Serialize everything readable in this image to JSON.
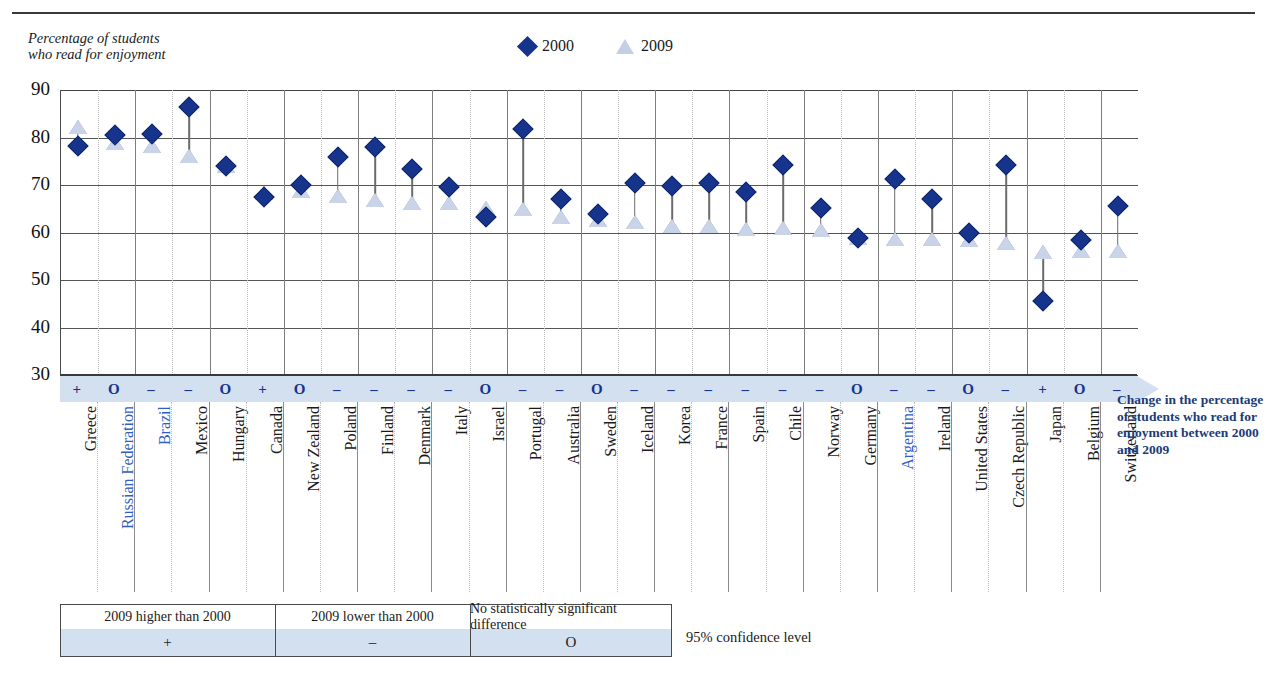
{
  "figure": {
    "y_caption_line1": "Percentage of students",
    "y_caption_line2": "who read for enjoyment",
    "annotation": "Change in the percentage of students who read for enjoyment between 2000 and 2009",
    "confidence_note": "95% confidence level"
  },
  "legend": [
    {
      "label": "2000",
      "marker": "diamond-icon",
      "color": "#16348c"
    },
    {
      "label": "2009",
      "marker": "triangle-icon",
      "color": "#c9d4e8"
    }
  ],
  "key_table": {
    "headers": [
      "2009 higher than 2000",
      "2009 lower than 2000",
      "No statistically significant difference"
    ],
    "symbols": [
      "+",
      "–",
      "O"
    ]
  },
  "chart_data": {
    "type": "scatter",
    "title": "",
    "xlabel": "",
    "ylabel": "Percentage of students who read for enjoyment",
    "ylim": [
      30,
      90
    ],
    "yticks": [
      90,
      80,
      70,
      60,
      50,
      40,
      30
    ],
    "grid": true,
    "legend_position": "top-center",
    "categories": [
      "Greece",
      "Russian Federation",
      "Brazil",
      "Mexico",
      "Hungary",
      "Canada",
      "New Zealand",
      "Poland",
      "Finland",
      "Denmark",
      "Italy",
      "Israel",
      "Portugal",
      "Australia",
      "Sweden",
      "Iceland",
      "Korea",
      "France",
      "Spain",
      "Chile",
      "Norway",
      "Germany",
      "Argentina",
      "Ireland",
      "United States",
      "Czech Republic",
      "Japan",
      "Belgium",
      "Switzerland"
    ],
    "partner_countries": [
      "Russian Federation",
      "Brazil",
      "Argentina"
    ],
    "series": [
      {
        "name": "2000",
        "values": [
          78.3,
          80.5,
          80.7,
          86.4,
          74.1,
          67.4,
          70.0,
          75.9,
          77.9,
          73.4,
          69.5,
          63.2,
          81.7,
          67.1,
          63.9,
          70.4,
          69.8,
          70.4,
          68.6,
          74.2,
          65.1,
          58.9,
          71.2,
          67.1,
          59.8,
          74.3,
          45.6,
          58.4,
          65.6
        ]
      },
      {
        "name": "2009",
        "values": [
          82.2,
          78.8,
          78.3,
          76.2,
          73.9,
          68.3,
          68.7,
          67.7,
          66.9,
          66.3,
          66.3,
          65.1,
          64.9,
          63.3,
          62.6,
          62.2,
          61.3,
          61.4,
          60.7,
          60.9,
          60.6,
          58.8,
          58.6,
          58.6,
          58.4,
          57.7,
          55.9,
          56.2,
          56.1
        ]
      }
    ],
    "significance": [
      "+",
      "O",
      "–",
      "–",
      "O",
      "+",
      "O",
      "–",
      "–",
      "–",
      "–",
      "O",
      "–",
      "–",
      "O",
      "–",
      "–",
      "–",
      "–",
      "–",
      "–",
      "O",
      "–",
      "–",
      "O",
      "–",
      "+",
      "O",
      "–"
    ]
  }
}
